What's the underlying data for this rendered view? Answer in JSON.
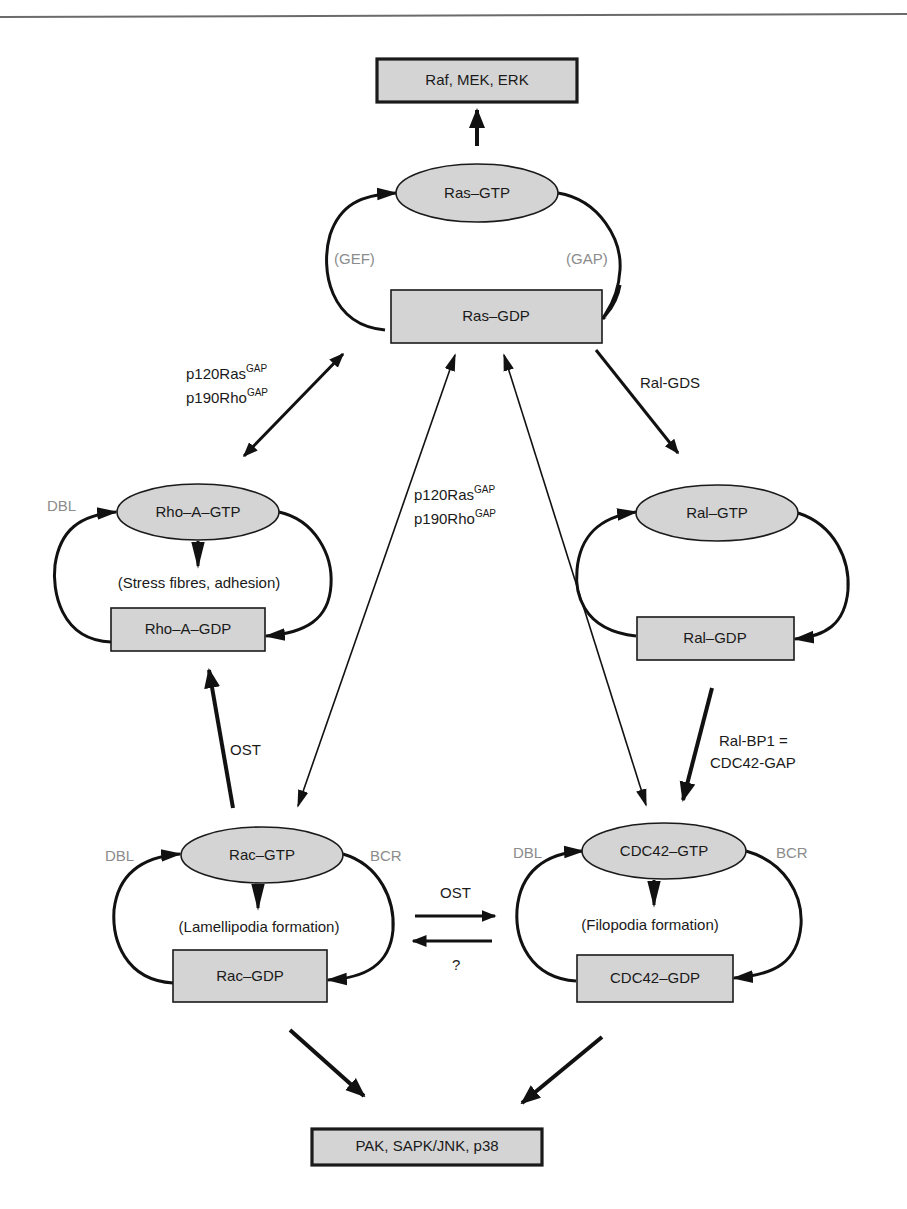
{
  "page": {
    "header_rule_color": "#6b6b6b"
  },
  "colors": {
    "node_fill": "#d4d4d4",
    "stroke": "#111111",
    "catalyst_label": "#8c8c8c",
    "text": "#1a1a1a"
  },
  "nodes": {
    "raf": "Raf, MEK, ERK",
    "ras_gtp": "Ras–GTP",
    "ras_gdp": "Ras–GDP",
    "rho_gtp": "Rho–A–GTP",
    "rho_gdp": "Rho–A–GDP",
    "ral_gtp": "Ral–GTP",
    "ral_gdp": "Ral–GDP",
    "rac_gtp": "Rac–GTP",
    "rac_gdp": "Rac–GDP",
    "cdc42_gtp": "CDC42–GTP",
    "cdc42_gdp": "CDC42–GDP",
    "pak": "PAK, SAPK/JNK, p38"
  },
  "effects": {
    "rho": "(Stress fibres, adhesion)",
    "rac": "(Lamellipodia formation)",
    "cdc42": "(Filopodia formation)"
  },
  "catalysts": {
    "ras_gef": "(GEF)",
    "ras_gap": "(GAP)",
    "rho_dbl": "DBL",
    "rac_dbl": "DBL",
    "rac_bcr": "BCR",
    "cdc42_dbl": "DBL",
    "cdc42_bcr": "BCR"
  },
  "edge_labels": {
    "ras_rho_line1": "p120Ras",
    "ras_rho_line1_sup": "GAP",
    "ras_rho_line2": "p190Rho",
    "ras_rho_line2_sup": "GAP",
    "center_line1": "p120Ras",
    "center_line1_sup": "GAP",
    "center_line2": "p190Rho",
    "center_line2_sup": "GAP",
    "ral_gds": "Ral-GDS",
    "ral_bp1_line1": "Ral-BP1 =",
    "ral_bp1_line2": "CDC42-GAP",
    "rac_to_rho": "OST",
    "rac_to_cdc42": "OST",
    "cdc42_to_rac": "?"
  }
}
